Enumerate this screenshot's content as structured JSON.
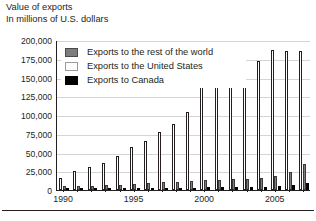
{
  "heading": {
    "line1": "Value of exports",
    "line2": "In millions of U.S. dollars"
  },
  "legend": {
    "items": [
      {
        "key": "rest_of_world",
        "label": "Exports to the rest of the world",
        "color": "#7d7d7d",
        "swatch": "row"
      },
      {
        "key": "united_states",
        "label": "Exports to the United States",
        "color": "#ffffff",
        "swatch": "us"
      },
      {
        "key": "canada",
        "label": "Exports to Canada",
        "color": "#000000",
        "swatch": "ca"
      }
    ]
  },
  "chart_data": {
    "type": "bar",
    "title": "Value of exports",
    "subtitle": "In millions of U.S. dollars",
    "xlabel": "",
    "ylabel": "In millions of U.S. dollars",
    "ylim": [
      0,
      200000
    ],
    "ytick_step": 25000,
    "ytick_labels": [
      "200,000",
      "175,000",
      "150,000",
      "125,000",
      "100,000",
      "75,000",
      "50,000",
      "25,000",
      "0"
    ],
    "ytick_values": [
      200000,
      175000,
      150000,
      125000,
      100000,
      75000,
      50000,
      25000,
      0
    ],
    "grid": true,
    "legend_position": "inside-top-left",
    "categories": [
      1990,
      1991,
      1992,
      1993,
      1994,
      1995,
      1996,
      1997,
      1998,
      1999,
      2000,
      2001,
      2002,
      2003,
      2004,
      2005,
      2006,
      2007
    ],
    "xtick_labels": [
      "1990",
      "1995",
      "2000",
      "2005"
    ],
    "xtick_categories": [
      1990,
      1995,
      2000,
      2005
    ],
    "series": [
      {
        "name": "Exports to the United States",
        "color": "#ffffff",
        "values": [
          16000,
          26000,
          31000,
          36000,
          45000,
          57000,
          66000,
          78000,
          88000,
          104000,
          150000,
          146000,
          149000,
          150000,
          172000,
          187000,
          185000,
          185000
        ]
      },
      {
        "name": "Exports to the rest of the world",
        "color": "#7d7d7d",
        "values": [
          5000,
          5500,
          6000,
          6500,
          7000,
          8500,
          9500,
          10500,
          11000,
          12000,
          14000,
          13500,
          14500,
          14500,
          16500,
          19000,
          24000,
          35000
        ]
      },
      {
        "name": "Exports to Canada",
        "color": "#000000",
        "values": [
          1500,
          1600,
          1700,
          1800,
          2000,
          2300,
          2600,
          3000,
          3000,
          3200,
          3600,
          3500,
          3700,
          3800,
          4200,
          5000,
          6500,
          9500
        ]
      }
    ]
  }
}
